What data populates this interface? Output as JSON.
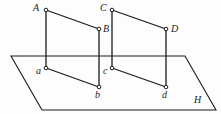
{
  "figure": {
    "background_color": "#fdfdfd",
    "stroke_color": "#1b1b1b",
    "vertex_fill_color": "#ffffff",
    "width": 221,
    "height": 114
  },
  "plane": {
    "name": "H",
    "label": "H",
    "label_x": 194,
    "label_y": 95,
    "corners": [
      {
        "name": "top-left",
        "x": 11,
        "y": 56
      },
      {
        "name": "top-right",
        "x": 185,
        "y": 56
      },
      {
        "name": "bottom-right",
        "x": 216,
        "y": 110
      },
      {
        "name": "bottom-left",
        "x": 42,
        "y": 110
      }
    ]
  },
  "points": [
    {
      "id": "A",
      "label": "A",
      "x": 46,
      "y": 10,
      "label_x": 33,
      "label_y": 3
    },
    {
      "id": "B",
      "label": "B",
      "x": 99,
      "y": 29,
      "label_x": 103,
      "label_y": 24
    },
    {
      "id": "C",
      "label": "C",
      "x": 112,
      "y": 10,
      "label_x": 100,
      "label_y": 3
    },
    {
      "id": "D",
      "label": "D",
      "x": 166,
      "y": 29,
      "label_x": 171,
      "label_y": 24
    },
    {
      "id": "a",
      "label": "a",
      "x": 46,
      "y": 68,
      "label_x": 36,
      "label_y": 66
    },
    {
      "id": "b",
      "label": "b",
      "x": 99,
      "y": 87,
      "label_x": 95,
      "label_y": 90
    },
    {
      "id": "c",
      "label": "c",
      "x": 112,
      "y": 68,
      "label_x": 103,
      "label_y": 66
    },
    {
      "id": "d",
      "label": "d",
      "x": 166,
      "y": 87,
      "label_x": 162,
      "label_y": 90
    }
  ],
  "segments": [
    {
      "id": "AB",
      "from": "A",
      "to": "B",
      "x1": 46,
      "y1": 10,
      "x2": 99,
      "y2": 29
    },
    {
      "id": "Aa",
      "from": "A",
      "to": "a",
      "x1": 46,
      "y1": 10,
      "x2": 46,
      "y2": 68
    },
    {
      "id": "Bb",
      "from": "B",
      "to": "b",
      "x1": 99,
      "y1": 29,
      "x2": 99,
      "y2": 87
    },
    {
      "id": "ab",
      "from": "a",
      "to": "b",
      "x1": 46,
      "y1": 68,
      "x2": 99,
      "y2": 87
    },
    {
      "id": "CD",
      "from": "C",
      "to": "D",
      "x1": 112,
      "y1": 10,
      "x2": 166,
      "y2": 29
    },
    {
      "id": "Cc",
      "from": "C",
      "to": "c",
      "x1": 112,
      "y1": 10,
      "x2": 112,
      "y2": 68
    },
    {
      "id": "Dd",
      "from": "D",
      "to": "d",
      "x1": 166,
      "y1": 29,
      "x2": 166,
      "y2": 87
    },
    {
      "id": "cd",
      "from": "c",
      "to": "d",
      "x1": 112,
      "y1": 68,
      "x2": 166,
      "y2": 87
    }
  ]
}
